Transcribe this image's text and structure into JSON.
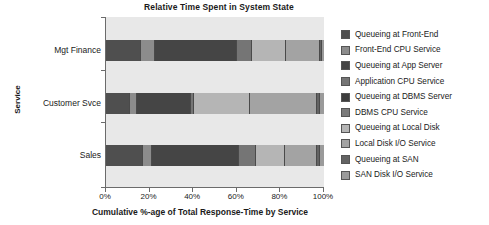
{
  "chart_data": {
    "type": "bar",
    "orientation": "horizontal",
    "stacked": true,
    "normalized": true,
    "title": "Relative Time Spent in System State",
    "xlabel": "Cumulative %-age of Total Response-Time by Service",
    "ylabel": "Service",
    "xlim": [
      0,
      100
    ],
    "grid": false,
    "legend_position": "right",
    "xtick_labels": [
      "0%",
      "20%",
      "40%",
      "60%",
      "80%",
      "100%"
    ],
    "xtick_values": [
      0,
      20,
      40,
      60,
      80,
      100
    ],
    "categories": [
      "Mgt Finance",
      "Customer Svce",
      "Sales"
    ],
    "series": [
      {
        "name": "Queueing at Front-End",
        "color": "#4f4f4f",
        "values": [
          16.0,
          11.0,
          17.0
        ]
      },
      {
        "name": "Front-End CPU Service",
        "color": "#8c8c8c",
        "values": [
          6.5,
          3.0,
          4.0
        ]
      },
      {
        "name": "Queueing at App Server",
        "color": "#454545",
        "values": [
          37.5,
          25.0,
          40.0
        ]
      },
      {
        "name": "Application CPU Service",
        "color": "#757575",
        "values": [
          7.0,
          1.5,
          8.0
        ]
      },
      {
        "name": "Queueing at DBMS Server",
        "color": "#3d3d3d",
        "values": [
          0.0,
          0.0,
          0.0
        ]
      },
      {
        "name": "DBMS CPU Service",
        "color": "#7a7a7a",
        "values": [
          0.0,
          0.0,
          0.0
        ]
      },
      {
        "name": "Queueing at Local Disk",
        "color": "#b5b5b5",
        "values": [
          15.5,
          25.5,
          13.0
        ]
      },
      {
        "name": "Local Disk I/O Service",
        "color": "#a3a3a3",
        "values": [
          15.5,
          31.0,
          15.0
        ]
      },
      {
        "name": "Queueing at SAN",
        "color": "#636363",
        "values": [
          1.0,
          1.0,
          1.0
        ]
      },
      {
        "name": "SAN Disk I/O Service",
        "color": "#9a9a9a",
        "values": [
          1.0,
          2.0,
          2.0
        ]
      }
    ]
  },
  "legend": {
    "items": [
      {
        "label": "Queueing at Front-End",
        "swatch": "legend-swatch-queueing-front-end"
      },
      {
        "label": "Front-End CPU Service",
        "swatch": "legend-swatch-front-end-cpu"
      },
      {
        "label": "Queueing at App Server",
        "swatch": "legend-swatch-queueing-app-server"
      },
      {
        "label": "Application CPU Service",
        "swatch": "legend-swatch-application-cpu"
      },
      {
        "label": "Queueing at DBMS Server",
        "swatch": "legend-swatch-queueing-dbms"
      },
      {
        "label": "DBMS CPU Service",
        "swatch": "legend-swatch-dbms-cpu"
      },
      {
        "label": "Queueing at Local Disk",
        "swatch": "legend-swatch-queueing-local-disk"
      },
      {
        "label": "Local Disk I/O Service",
        "swatch": "legend-swatch-local-disk-io"
      },
      {
        "label": "Queueing at SAN",
        "swatch": "legend-swatch-queueing-san"
      },
      {
        "label": "SAN Disk I/O Service",
        "swatch": "legend-swatch-san-disk-io"
      }
    ]
  },
  "colors": {
    "plot_background": "#e8e8e8",
    "axis_line": "#6b6b6b",
    "text": "#1a1a1a",
    "segment_divider": "#4a4a4a"
  }
}
